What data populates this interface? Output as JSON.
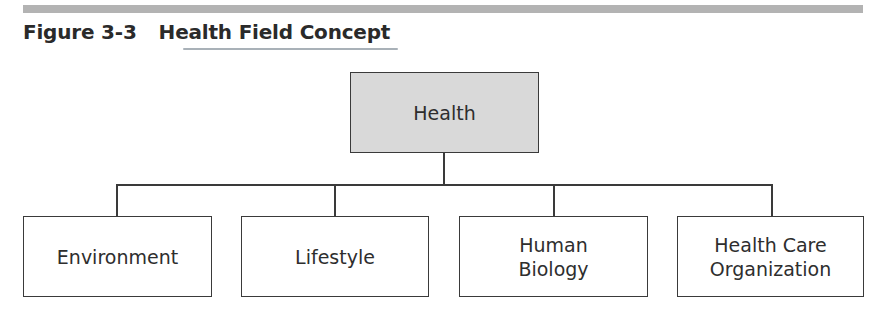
{
  "figure": {
    "number": "Figure 3-3",
    "title": "Health Field Concept"
  },
  "diagram": {
    "root": {
      "label": "Health",
      "fill": "#d9d9d9"
    },
    "children": [
      {
        "label": "Environment"
      },
      {
        "label": "Lifestyle"
      },
      {
        "label": "Human Biology",
        "lines": [
          "Human",
          "Biology"
        ]
      },
      {
        "label": "Health Care Organization",
        "lines": [
          "Health Care",
          "Organization"
        ]
      }
    ]
  }
}
